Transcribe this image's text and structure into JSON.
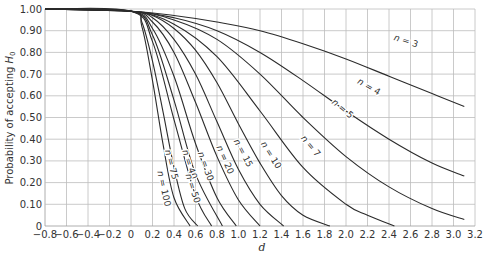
{
  "chart_data": {
    "type": "line",
    "title": "",
    "xlabel": "d",
    "ylabel": "Probability of accepting H0",
    "xlim": [
      -0.8,
      3.2
    ],
    "ylim": [
      0,
      1.0
    ],
    "grid": true,
    "legend": "inline curve labels",
    "x_ticks": [
      "−0.8",
      "−0.6",
      "−0.4",
      "−0.2",
      "0",
      "0.2",
      "0.4",
      "0.6",
      "0.8",
      "1.0",
      "1.2",
      "1.4",
      "1.6",
      "1.8",
      "2.0",
      "2.2",
      "2.4",
      "2.6",
      "2.8",
      "3.0",
      "3.2"
    ],
    "y_ticks": [
      "0",
      "0.10",
      "0.20",
      "0.30",
      "0.40",
      "0.50",
      "0.60",
      "0.70",
      "0.80",
      "0.90",
      "1.00"
    ],
    "series": [
      {
        "name": "n = 3",
        "label_pos": [
          2.55,
          0.84
        ],
        "label_rot": 18,
        "x": [
          -0.8,
          0,
          0.4,
          0.8,
          1.2,
          1.6,
          2.0,
          2.4,
          2.8,
          3.1
        ],
        "y": [
          1.0,
          0.99,
          0.97,
          0.94,
          0.9,
          0.84,
          0.77,
          0.69,
          0.61,
          0.55
        ]
      },
      {
        "name": "n = 4",
        "label_pos": [
          2.2,
          0.63
        ],
        "label_rot": 30,
        "x": [
          -0.8,
          0,
          0.4,
          0.8,
          1.2,
          1.6,
          2.0,
          2.4,
          2.8,
          3.1
        ],
        "y": [
          1.0,
          0.99,
          0.96,
          0.9,
          0.8,
          0.67,
          0.53,
          0.4,
          0.29,
          0.23
        ]
      },
      {
        "name": "n = 5",
        "label_pos": [
          1.95,
          0.53
        ],
        "label_rot": 40,
        "x": [
          -0.8,
          0,
          0.4,
          0.8,
          1.2,
          1.6,
          2.0,
          2.4,
          2.8,
          3.1
        ],
        "y": [
          1.0,
          0.99,
          0.95,
          0.86,
          0.7,
          0.5,
          0.32,
          0.18,
          0.08,
          0.03
        ]
      },
      {
        "name": "n = 7",
        "label_pos": [
          1.65,
          0.36
        ],
        "label_rot": 50,
        "x": [
          -0.8,
          0,
          0.4,
          0.8,
          1.2,
          1.6,
          2.0,
          2.2,
          2.45
        ],
        "y": [
          1.0,
          0.99,
          0.93,
          0.78,
          0.53,
          0.27,
          0.1,
          0.05,
          0.0
        ]
      },
      {
        "name": "n = 10",
        "label_pos": [
          1.28,
          0.32
        ],
        "label_rot": 58,
        "x": [
          -0.8,
          0,
          0.2,
          0.4,
          0.6,
          0.8,
          1.0,
          1.2,
          1.4,
          1.6,
          1.85
        ],
        "y": [
          1.0,
          0.99,
          0.97,
          0.91,
          0.81,
          0.66,
          0.47,
          0.29,
          0.14,
          0.05,
          0.0
        ]
      },
      {
        "name": "n = 15",
        "label_pos": [
          1.02,
          0.33
        ],
        "label_rot": 62,
        "x": [
          -0.8,
          0,
          0.2,
          0.4,
          0.6,
          0.8,
          1.0,
          1.2,
          1.42
        ],
        "y": [
          1.0,
          0.99,
          0.96,
          0.86,
          0.7,
          0.48,
          0.26,
          0.1,
          0.0
        ]
      },
      {
        "name": "n = 20",
        "label_pos": [
          0.85,
          0.3
        ],
        "label_rot": 66,
        "x": [
          -0.8,
          0,
          0.2,
          0.4,
          0.6,
          0.8,
          1.0,
          1.2
        ],
        "y": [
          1.0,
          0.99,
          0.94,
          0.8,
          0.57,
          0.32,
          0.12,
          0.0
        ]
      },
      {
        "name": "n = 30",
        "label_pos": [
          0.67,
          0.27
        ],
        "label_rot": 70,
        "x": [
          -0.8,
          0,
          0.2,
          0.4,
          0.6,
          0.8,
          0.98
        ],
        "y": [
          1.0,
          0.99,
          0.91,
          0.69,
          0.38,
          0.13,
          0.0
        ]
      },
      {
        "name": "n = 40",
        "label_pos": [
          0.52,
          0.28
        ],
        "label_rot": 72,
        "x": [
          -0.8,
          0,
          0.2,
          0.4,
          0.6,
          0.85
        ],
        "y": [
          1.0,
          0.99,
          0.88,
          0.58,
          0.24,
          0.0
        ]
      },
      {
        "name": "n = 50",
        "label_pos": [
          0.55,
          0.17
        ],
        "label_rot": 72,
        "x": [
          -0.8,
          0,
          0.2,
          0.4,
          0.6,
          0.75
        ],
        "y": [
          1.0,
          0.99,
          0.85,
          0.49,
          0.14,
          0.0
        ]
      },
      {
        "name": "n = 75",
        "label_pos": [
          0.35,
          0.28
        ],
        "label_rot": 75,
        "x": [
          -0.8,
          0,
          0.1,
          0.2,
          0.3,
          0.4,
          0.5,
          0.62
        ],
        "y": [
          1.0,
          0.99,
          0.94,
          0.76,
          0.52,
          0.27,
          0.08,
          0.0
        ]
      },
      {
        "name": "n = 100",
        "label_pos": [
          0.28,
          0.17
        ],
        "label_rot": 78,
        "x": [
          -0.8,
          0,
          0.1,
          0.2,
          0.3,
          0.4,
          0.55
        ],
        "y": [
          1.0,
          0.99,
          0.92,
          0.67,
          0.37,
          0.13,
          0.0
        ]
      }
    ]
  },
  "labels": {
    "ylabel_prefix": "Probability of accepting ",
    "ylabel_var": "H",
    "ylabel_sub": "0",
    "xlabel": "d"
  },
  "colors": {
    "curve": "#2b2b2b",
    "grid": "#bdbdbd",
    "axis": "#999999",
    "text": "#333333"
  }
}
